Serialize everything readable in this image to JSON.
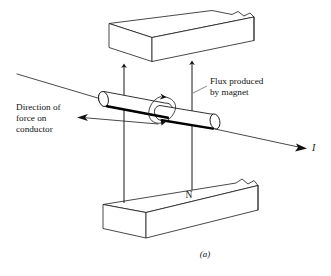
{
  "figure": {
    "caption": "(a)",
    "background_color": "#ffffff",
    "line_color": "#1a1a1a"
  },
  "labels": {
    "flux": {
      "line1": "Flux produced",
      "line2": "by magnet"
    },
    "force": {
      "line1": "Direction of",
      "line2": "force on",
      "line3": "conductor"
    },
    "pole_north": "N",
    "current": "I"
  },
  "elements": {
    "upper_magnet_name": "upper-magnet-block",
    "lower_magnet_name": "lower-magnet-block",
    "conductor_name": "conductor-cylinder",
    "flux_loop_name": "conductor-flux-loop"
  }
}
